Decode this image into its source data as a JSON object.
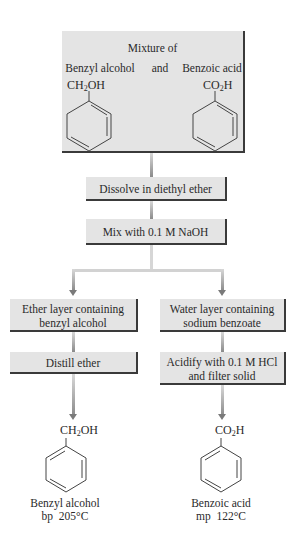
{
  "start": {
    "title": "Mixture of",
    "left_compound": "Benzyl alcohol",
    "conjunction": "and",
    "right_compound": "Benzoic acid",
    "left_formula": {
      "a": "CH",
      "sub": "2",
      "b": "OH"
    },
    "right_formula": {
      "a": "CO",
      "sub": "2",
      "b": "H"
    }
  },
  "steps": {
    "dissolve": "Dissolve in diethyl ether",
    "mix": "Mix with 0.1 M NaOH"
  },
  "branches": {
    "left": {
      "layer_line1": "Ether layer containing",
      "layer_line2": "benzyl alcohol",
      "step": "Distill ether"
    },
    "right": {
      "layer_line1": "Water layer containing",
      "layer_line2": "sodium benzoate",
      "step_line1": "Acidify with 0.1 M HCl",
      "step_line2": "and filter solid"
    }
  },
  "products": {
    "left": {
      "formula": {
        "a": "CH",
        "sub": "2",
        "b": "OH"
      },
      "name": "Benzyl alcohol",
      "property": "bp  205°C"
    },
    "right": {
      "formula": {
        "a": "CO",
        "sub": "2",
        "b": "H"
      },
      "name": "Benzoic acid",
      "property": "mp  122°C"
    }
  },
  "colors": {
    "box_fill": "#e4e4e4",
    "box_shadow": "#3a3a3a",
    "connector": "#8a8a8a"
  }
}
